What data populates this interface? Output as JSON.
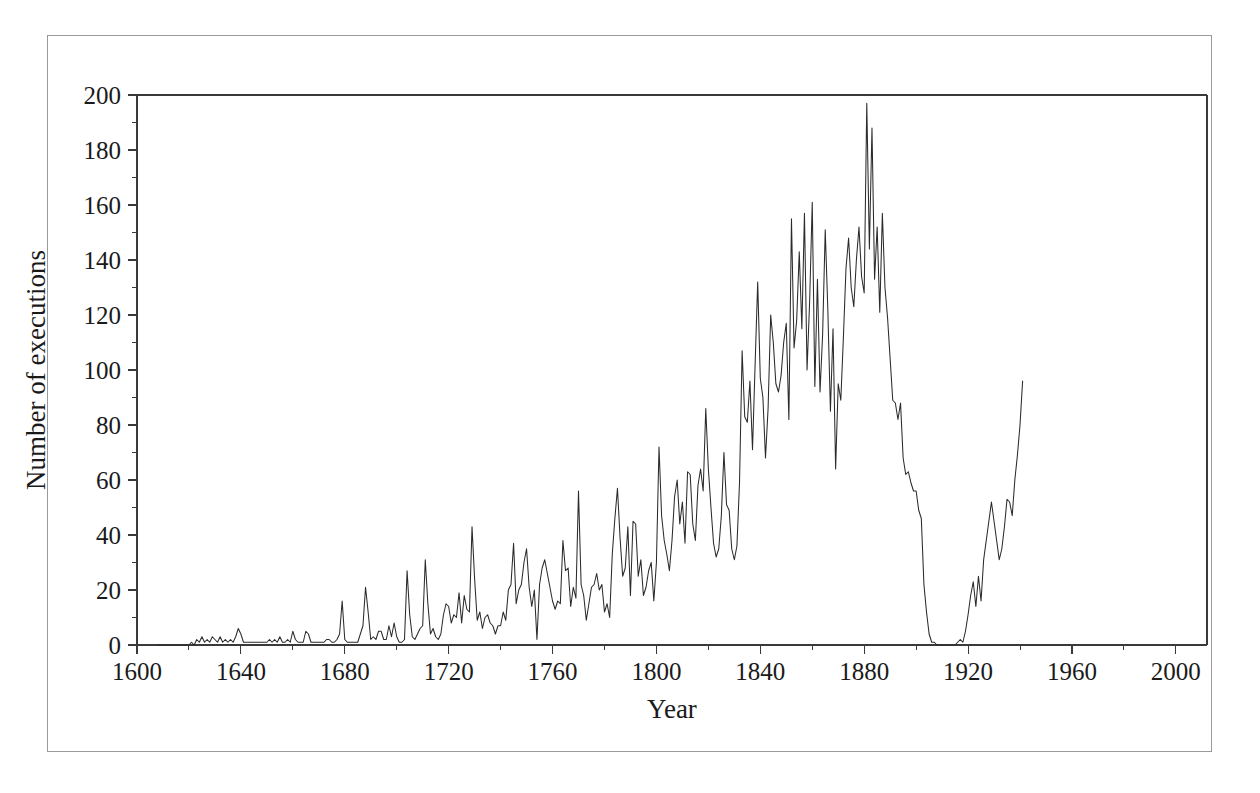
{
  "chart_data": {
    "type": "line",
    "title": "",
    "xlabel": "Year",
    "ylabel": "Number of executions",
    "xlim": [
      1600,
      2012
    ],
    "ylim": [
      0,
      200
    ],
    "grid": false,
    "legend": null,
    "x_ticks": [
      1600,
      1640,
      1680,
      1720,
      1760,
      1800,
      1840,
      1880,
      1920,
      1960,
      2000
    ],
    "x_minor_step": 20,
    "y_ticks": [
      0,
      20,
      40,
      60,
      80,
      100,
      120,
      140,
      160,
      180,
      200
    ],
    "y_minor_step": 10,
    "series_name": "Executions",
    "line_color": "#2b2b2b",
    "axis_color": "#3a3a3a",
    "frame_color": "#9a9a9a",
    "background_color": "#ffffff",
    "x_start": 1608,
    "values": [
      0,
      0,
      0,
      0,
      0,
      0,
      0,
      0,
      0,
      0,
      0,
      0,
      0,
      1,
      0,
      2,
      1,
      3,
      1,
      2,
      1,
      3,
      2,
      1,
      3,
      1,
      2,
      1,
      2,
      1,
      3,
      6,
      4,
      1,
      1,
      1,
      1,
      1,
      1,
      1,
      1,
      1,
      1,
      2,
      1,
      2,
      1,
      3,
      1,
      1,
      2,
      1,
      5,
      2,
      1,
      1,
      1,
      5,
      4,
      1,
      1,
      1,
      1,
      1,
      1,
      2,
      2,
      1,
      1,
      2,
      4,
      16,
      2,
      1,
      1,
      1,
      1,
      1,
      4,
      7,
      21,
      12,
      2,
      3,
      2,
      5,
      5,
      2,
      2,
      7,
      3,
      8,
      3,
      1,
      1,
      2,
      27,
      11,
      3,
      2,
      4,
      6,
      7,
      31,
      15,
      4,
      6,
      3,
      2,
      4,
      11,
      15,
      14,
      8,
      11,
      10,
      19,
      8,
      18,
      13,
      12,
      43,
      24,
      9,
      12,
      6,
      10,
      11,
      8,
      7,
      4,
      7,
      7,
      12,
      9,
      20,
      22,
      37,
      15,
      20,
      22,
      30,
      35,
      21,
      14,
      20,
      2,
      22,
      28,
      31,
      26,
      21,
      16,
      13,
      16,
      15,
      38,
      27,
      28,
      14,
      21,
      17,
      56,
      22,
      18,
      9,
      15,
      21,
      22,
      26,
      20,
      22,
      12,
      15,
      10,
      33,
      46,
      57,
      39,
      25,
      28,
      43,
      18,
      45,
      44,
      25,
      31,
      18,
      21,
      27,
      30,
      16,
      30,
      72,
      47,
      38,
      33,
      27,
      38,
      54,
      60,
      44,
      52,
      37,
      63,
      62,
      44,
      38,
      58,
      64,
      56,
      86,
      64,
      50,
      37,
      32,
      35,
      47,
      70,
      51,
      49,
      35,
      31,
      36,
      59,
      107,
      83,
      81,
      96,
      71,
      102,
      132,
      97,
      90,
      68,
      86,
      120,
      110,
      95,
      92,
      98,
      110,
      117,
      82,
      155,
      108,
      118,
      143,
      115,
      157,
      100,
      125,
      161,
      94,
      133,
      92,
      113,
      151,
      122,
      85,
      115,
      64,
      95,
      89,
      112,
      137,
      148,
      130,
      123,
      140,
      152,
      134,
      128,
      197,
      144,
      188,
      133,
      152,
      121,
      157,
      130,
      119,
      104,
      89,
      88,
      82,
      88,
      68,
      62,
      63,
      59,
      56,
      56,
      49,
      46,
      22,
      12,
      4,
      1,
      1,
      0,
      0,
      0,
      0,
      0,
      0,
      0,
      0,
      1,
      2,
      1,
      5,
      11,
      18,
      23,
      14,
      25,
      16,
      31,
      38,
      45,
      52,
      45,
      38,
      31,
      35,
      43,
      53,
      52,
      47,
      60,
      69,
      80,
      96
    ]
  }
}
